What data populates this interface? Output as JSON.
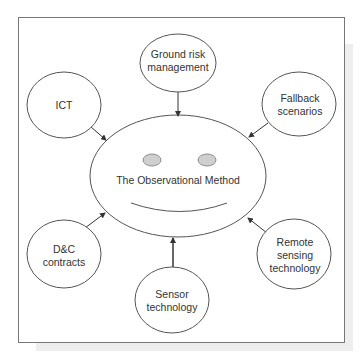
{
  "diagram": {
    "center": {
      "label": "The Observational Method"
    },
    "nodes": [
      {
        "id": "ground-risk",
        "lines": [
          "Ground risk",
          "management"
        ]
      },
      {
        "id": "ict",
        "lines": [
          "ICT"
        ]
      },
      {
        "id": "fallback",
        "lines": [
          "Fallback",
          "scenarios"
        ]
      },
      {
        "id": "dc-contracts",
        "lines": [
          "D&C",
          "contracts"
        ]
      },
      {
        "id": "remote-sensing",
        "lines": [
          "Remote",
          "sensing",
          "technology"
        ]
      },
      {
        "id": "sensor-tech",
        "lines": [
          "Sensor",
          "technology"
        ]
      }
    ],
    "edges": [
      {
        "from": "ground-risk",
        "to": "center"
      },
      {
        "from": "ict",
        "to": "center"
      },
      {
        "from": "fallback",
        "to": "center"
      },
      {
        "from": "dc-contracts",
        "to": "center"
      },
      {
        "from": "remote-sensing",
        "to": "center"
      },
      {
        "from": "sensor-tech",
        "to": "center"
      }
    ],
    "colors": {
      "stroke": "#555555",
      "text": "#333333",
      "eye_fill": "#cfcfcf",
      "shadow": "#eeeeee"
    }
  }
}
